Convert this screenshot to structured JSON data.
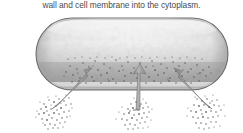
{
  "figure": {
    "caption": "wall and cell membrane into the cytoplasm.",
    "alt_description": "Rod-shaped bacterial cell with three arrows showing particles entering through the cell wall and membrane into the cytoplasm",
    "background_color": "#ffffff",
    "caption_color": "#4a4a4a"
  },
  "cell": {
    "name": "bacterial-cell",
    "shape": "capsule",
    "bounds": {
      "x": 36,
      "y": 18,
      "width": 192,
      "height": 72
    },
    "corner_radius": 36,
    "outline_color": "#6e6e6e",
    "body_light": "#f2f2f2",
    "body_mid": "#c8c8c8",
    "body_dark": "#9a9a9a",
    "highlight_color": "#fbfbfb",
    "membrane_band_color": "#dcdcdc",
    "interior_stipple_color": "#4f4f4f"
  },
  "stipple_band": {
    "name": "cytoplasm-particle-band",
    "x": 62,
    "y": 56,
    "width": 150,
    "height": 32,
    "dot_color": "#4a4a4a"
  },
  "arrows": [
    {
      "name": "arrow-left",
      "x1": 58,
      "y1": 108,
      "x2": 88,
      "y2": 70,
      "color": "#9b9b9b",
      "edge_color": "#6f6f6f"
    },
    {
      "name": "arrow-middle",
      "x1": 137,
      "y1": 110,
      "x2": 141,
      "y2": 66,
      "color": "#9b9b9b",
      "edge_color": "#6f6f6f"
    },
    {
      "name": "arrow-right",
      "x1": 206,
      "y1": 108,
      "x2": 180,
      "y2": 70,
      "color": "#9b9b9b",
      "edge_color": "#6f6f6f"
    }
  ],
  "particle_clusters": [
    {
      "name": "particle-cluster-left",
      "cx": 57,
      "cy": 112,
      "rx": 19,
      "ry": 14,
      "count": 78,
      "dot_color": "#6a6a6a"
    },
    {
      "name": "particle-cluster-middle",
      "cx": 137,
      "cy": 115,
      "rx": 17,
      "ry": 13,
      "count": 70,
      "dot_color": "#6a6a6a"
    },
    {
      "name": "particle-cluster-right",
      "cx": 208,
      "cy": 113,
      "rx": 18,
      "ry": 14,
      "count": 74,
      "dot_color": "#6a6a6a"
    }
  ]
}
